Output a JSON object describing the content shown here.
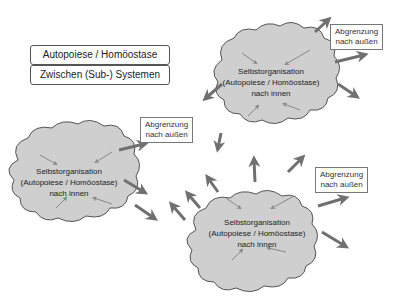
{
  "legend": {
    "items": [
      "Autopoiese / Homöostase",
      "Zwischen (Sub-) Systemen"
    ]
  },
  "clouds": [
    {
      "lines": [
        "Selbstorganisation",
        "(Autopoiese / Homöostase)",
        "nach innen"
      ]
    },
    {
      "lines": [
        "Selbstorganisation",
        "(Autopoiese / Homöostase)",
        "nach innen"
      ]
    },
    {
      "lines": [
        "Selbstorganisation",
        "(Autopoiese / Homöostase)",
        "nach innen"
      ]
    }
  ],
  "boundary_labels": [
    {
      "lines": [
        "Abgrenzung",
        "nach außen"
      ]
    },
    {
      "lines": [
        "Abgrenzung",
        "nach außen"
      ]
    },
    {
      "lines": [
        "Abgrenzung",
        "nach außen"
      ]
    }
  ],
  "colors": {
    "cloud_fill": "#cfcfcf",
    "cloud_stroke": "#555555",
    "arrow": "#707070"
  }
}
